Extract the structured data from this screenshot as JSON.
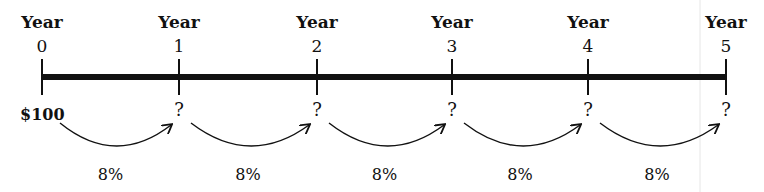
{
  "diagram": {
    "year_word": "Year",
    "years": [
      "0",
      "1",
      "2",
      "3",
      "4",
      "5"
    ],
    "tick_x": [
      42,
      179,
      317,
      452,
      588,
      726
    ],
    "start_value": "$100",
    "unknown_marker": "?",
    "rate": "8%",
    "rates": [
      "8%",
      "8%",
      "8%",
      "8%",
      "8%"
    ],
    "colors": {
      "line": "#111111",
      "background": "#ffffff"
    }
  }
}
